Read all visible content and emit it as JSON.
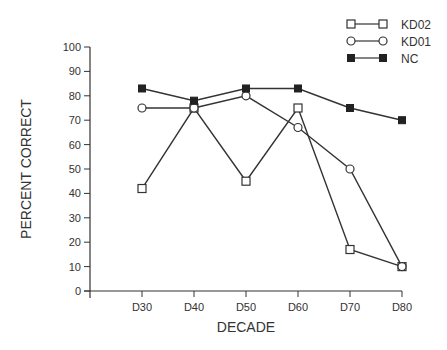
{
  "chart_data": {
    "type": "line",
    "title": "",
    "xlabel": "DECADE",
    "ylabel": "PERCENT CORRECT",
    "categories": [
      "D30",
      "D40",
      "D50",
      "D60",
      "D70",
      "D80"
    ],
    "ylim": [
      0,
      100
    ],
    "yticks": [
      0,
      10,
      20,
      30,
      40,
      50,
      60,
      70,
      80,
      90,
      100
    ],
    "grid": false,
    "legend_position": "top-right",
    "series": [
      {
        "name": "KD02",
        "marker": "open-square",
        "values": [
          42,
          75,
          45,
          75,
          17,
          10
        ]
      },
      {
        "name": "KD01",
        "marker": "open-circle",
        "values": [
          75,
          75,
          80,
          67,
          50,
          10
        ]
      },
      {
        "name": "NC",
        "marker": "filled-square",
        "values": [
          83,
          78,
          83,
          83,
          75,
          70
        ]
      }
    ]
  },
  "colors": {
    "line": "#333333",
    "marker_fill_filled": "#222222",
    "marker_fill_open": "#ffffff",
    "text": "#333333"
  }
}
